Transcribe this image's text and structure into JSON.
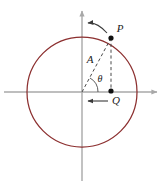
{
  "figure": {
    "width": 165,
    "height": 186,
    "background_color": "#ffffff"
  },
  "colors": {
    "circle_stroke": "#8c2f2f",
    "axis_stroke": "#a8a8a8",
    "dashed_stroke": "#4a4a4a",
    "point_fill": "#111111",
    "label_text": "#1a1a1a",
    "arrow_stroke": "#3a3a3a"
  },
  "axes": {
    "origin": {
      "x": 82,
      "y": 92
    },
    "x_axis": {
      "name": "x-axis",
      "x_start": 4,
      "x_end": 161,
      "y": 92,
      "arrowhead": "right"
    },
    "y_axis": {
      "name": "y-axis",
      "y_start": 7,
      "y_end": 181,
      "x": 82,
      "arrowhead": "top"
    }
  },
  "circle": {
    "name": "trajectory-circle",
    "center_x": 82,
    "center_y": 92,
    "radius": 55,
    "stroke_width": 1.2
  },
  "points": [
    {
      "id": "P",
      "label": "P",
      "x": 111,
      "y": 38,
      "description": "particle on circle",
      "label_offset_x": 9,
      "label_offset_y": -6
    },
    {
      "id": "Q",
      "label": "Q",
      "x": 111,
      "y": 91,
      "description": "projection of P on the x-axis",
      "label_offset_x": 5,
      "label_offset_y": 13
    }
  ],
  "segments": [
    {
      "name": "radius-line",
      "from": "origin",
      "to": "P",
      "style": "dashed",
      "label": "A",
      "label_x": 90,
      "label_y": 61
    },
    {
      "name": "projection-line",
      "from": "P",
      "to": "Q",
      "style": "dashed",
      "label": ""
    }
  ],
  "angle": {
    "name": "theta-angle",
    "label": "θ",
    "label_x": 99,
    "label_y": 81,
    "arc_radius": 16,
    "vertex_x": 82,
    "vertex_y": 92,
    "degrees": 62
  },
  "arrows": [
    {
      "name": "tangential-velocity-arrow",
      "label": "",
      "style": "curved",
      "direction": "left",
      "from_x": 105,
      "from_y": 31,
      "to_x": 86,
      "to_y": 24
    },
    {
      "name": "projection-velocity-arrow",
      "label": "",
      "style": "straight",
      "direction": "left",
      "from_x": 108,
      "from_y": 101,
      "to_x": 86,
      "to_y": 101
    }
  ]
}
